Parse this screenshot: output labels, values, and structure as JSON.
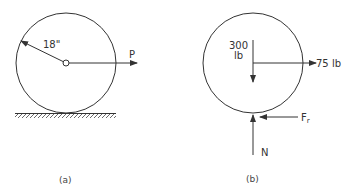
{
  "figure_a": {
    "radius_label": "18\"",
    "force_label": "P",
    "caption": "(a)"
  },
  "figure_b": {
    "weight_value": "300",
    "weight_unit": "lb",
    "applied_force_label": "75 lb",
    "friction_label": "F",
    "friction_subscript": "r",
    "normal_label": "N",
    "caption": "(b)"
  },
  "colors": {
    "line": "#333333",
    "background": "#ffffff"
  }
}
